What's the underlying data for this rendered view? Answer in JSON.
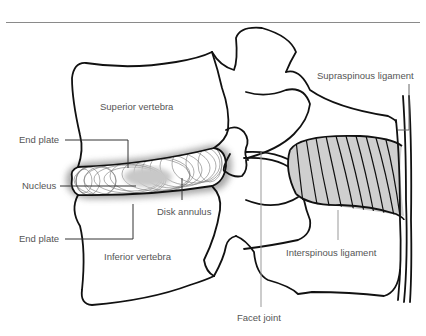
{
  "figure": {
    "labels": {
      "superior_vertebra": "Superior vertebra",
      "inferior_vertebra": "Inferior vertebra",
      "end_plate_top": "End plate",
      "end_plate_bottom": "End plate",
      "nucleus": "Nucleus",
      "disk_annulus": "Disk annulus",
      "facet_joint": "Facet joint",
      "supraspinous_ligament": "Supraspinous ligament",
      "interspinous_ligament": "Interspinous ligament"
    },
    "colors": {
      "outline": "#111111",
      "label_text": "#555555",
      "leader_line": "#333333",
      "disk_shadow": "#9a9a9a",
      "nucleus_fill": "#c8c8c8",
      "ligament_fill": "#cfcfcf",
      "header_rule": "#8a8a8a"
    }
  }
}
